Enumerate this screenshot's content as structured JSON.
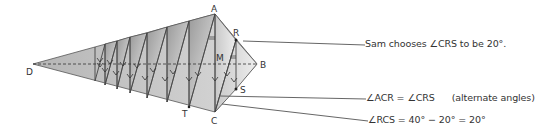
{
  "diagram": {
    "type": "geometric folding diagram (kite with repeated folds)",
    "points": {
      "A": "A",
      "B": "B",
      "C": "C",
      "D": "D",
      "R": "R",
      "S": "S",
      "M": "M",
      "T": "T"
    },
    "annotations": {
      "sam_choice": "Sam chooses ∠CRS to be 20°.",
      "alternate": "∠ACR = ∠CRS",
      "alternate_reason": "(alternate angles)",
      "rcs": "∠RCS = 40° − 20° = 20°"
    },
    "colors": {
      "line": "#555555",
      "fill_dark": "#a8a8a8",
      "fill_light": "#e6e6e6",
      "text": "#333333"
    }
  }
}
